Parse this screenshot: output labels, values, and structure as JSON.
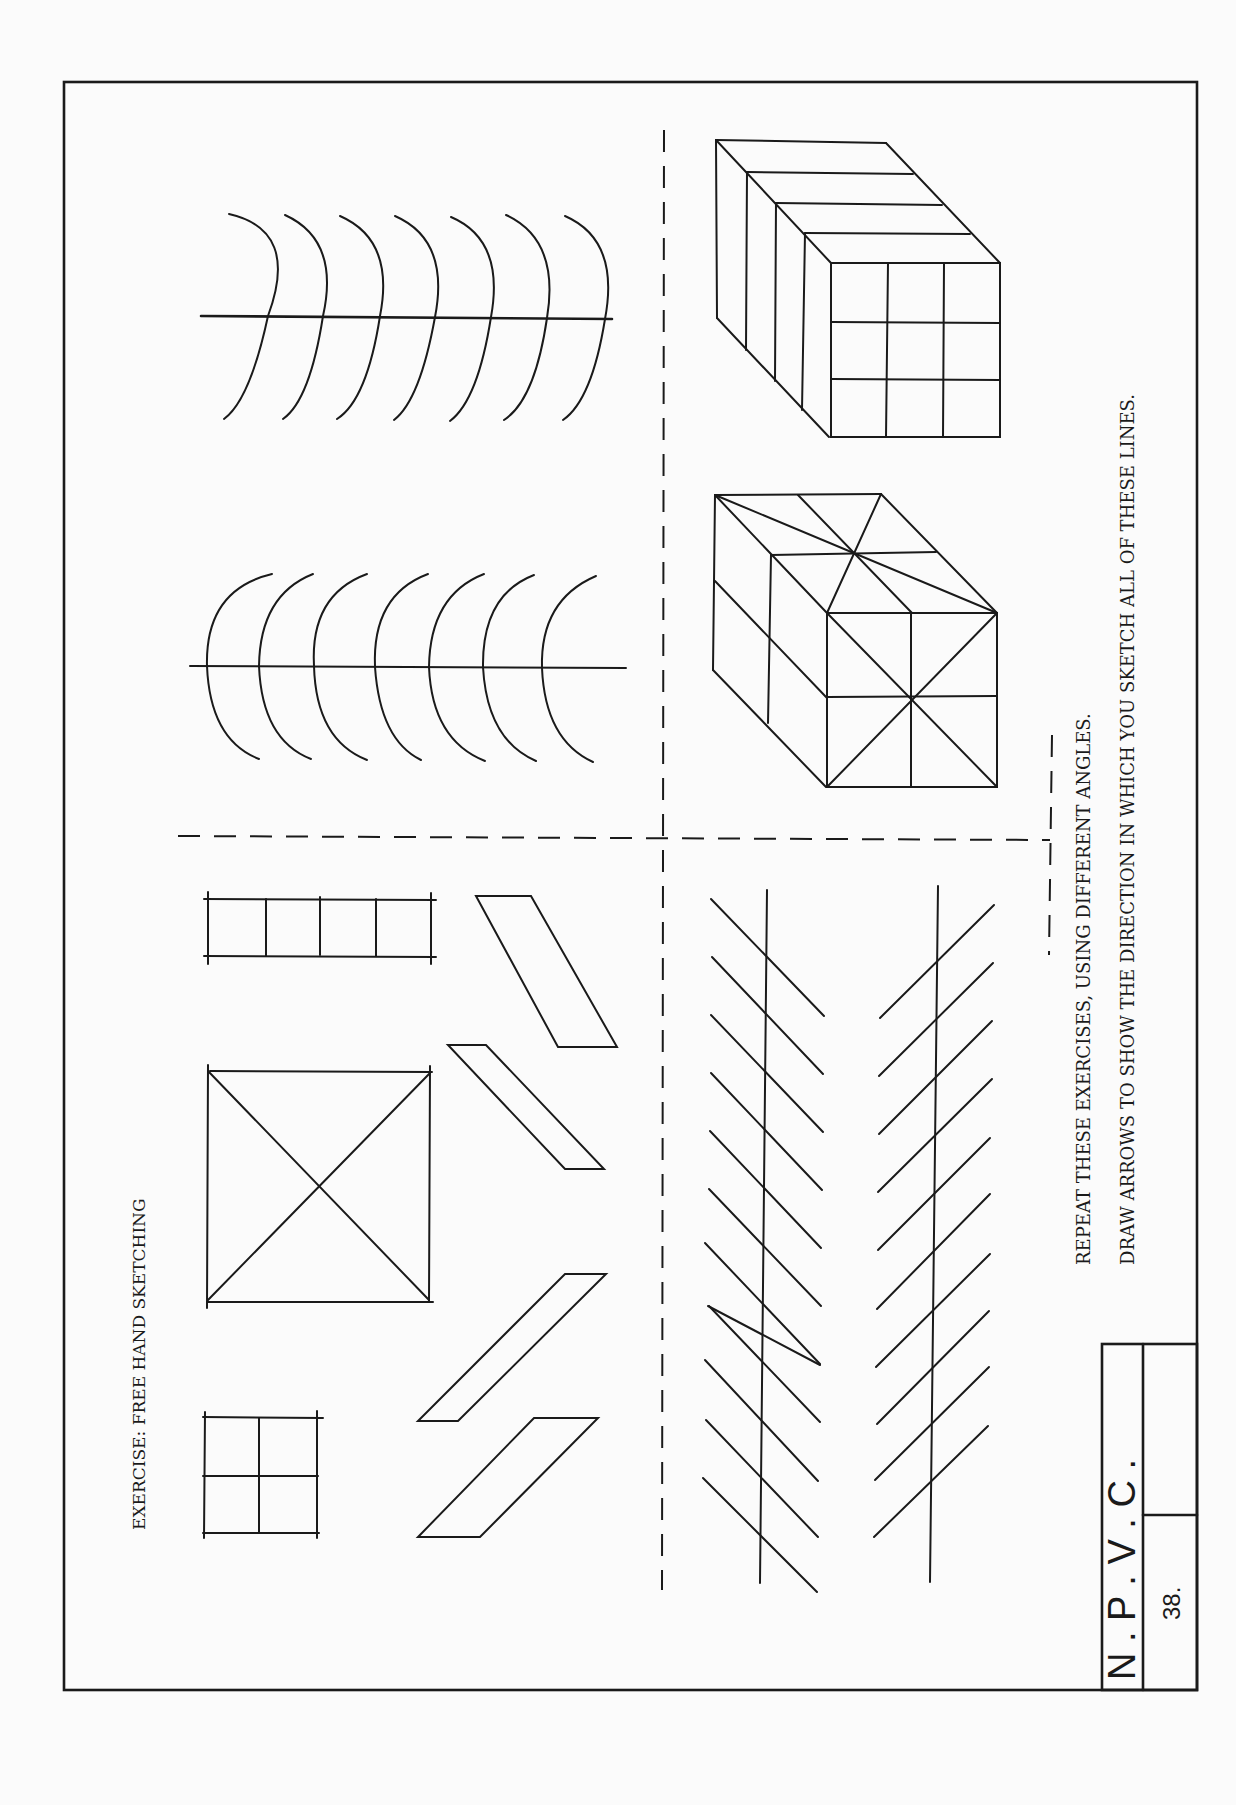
{
  "page": {
    "title": "EXERCISE: FREE HAND SKETCHING",
    "instructions": [
      "REPEAT THESE EXERCISES, USING DIFFERENT ANGLES.",
      "DRAW ARROWS TO SHOW THE DIRECTION IN WHICH YOU SKETCH ALL OF THESE LINES."
    ],
    "title_block": {
      "organization": "N . P . V . C .",
      "page_number": "38."
    },
    "ink_color": "#1a1a1a",
    "paper_color": "#fbfbfb"
  },
  "exercises": [
    {
      "name": "arcs-concave-right",
      "description": "Seven arcs crossing a horizontal line"
    },
    {
      "name": "arcs-concave-left",
      "description": "Seven arcs crossing a horizontal line"
    },
    {
      "name": "cube-grid",
      "description": "Box with grid on faces"
    },
    {
      "name": "cube-diagonals",
      "description": "Box with diagonals on faces"
    },
    {
      "name": "ladder-rectangle",
      "description": "Rectangle divided into four"
    },
    {
      "name": "square-with-x",
      "description": "Square with diagonals"
    },
    {
      "name": "square-quadrants",
      "description": "Square divided into four"
    },
    {
      "name": "parallelograms",
      "description": "Four slanted parallelograms"
    },
    {
      "name": "herringbone-left",
      "description": "Vertical line crossed by parallel slanted lines"
    },
    {
      "name": "herringbone-right",
      "description": "Vertical line crossed by parallel slanted lines"
    }
  ]
}
